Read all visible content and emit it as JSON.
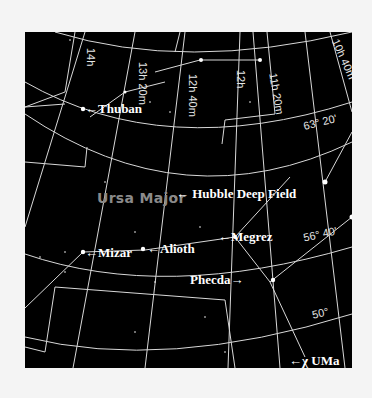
{
  "map": {
    "constellation": "Ursa Major",
    "right_ascension_labels": [
      "14h",
      "13h 20m",
      "12h 40m",
      "12h",
      "11h 20m",
      "10h 40m"
    ],
    "declination_labels": [
      "63° 20'",
      "56° 40'",
      "50°"
    ],
    "stars": [
      {
        "name": "Thuban"
      },
      {
        "name": "Mizar"
      },
      {
        "name": "Alioth"
      },
      {
        "name": "Megrez"
      },
      {
        "name": "Phecda"
      },
      {
        "name": "χ UMa"
      }
    ],
    "target": "Hubble Deep Field",
    "colors": {
      "background": "#000000",
      "lines": "#d8d8d8",
      "labels": "#ffffff",
      "constellation_label": "#8a8a8a"
    }
  }
}
